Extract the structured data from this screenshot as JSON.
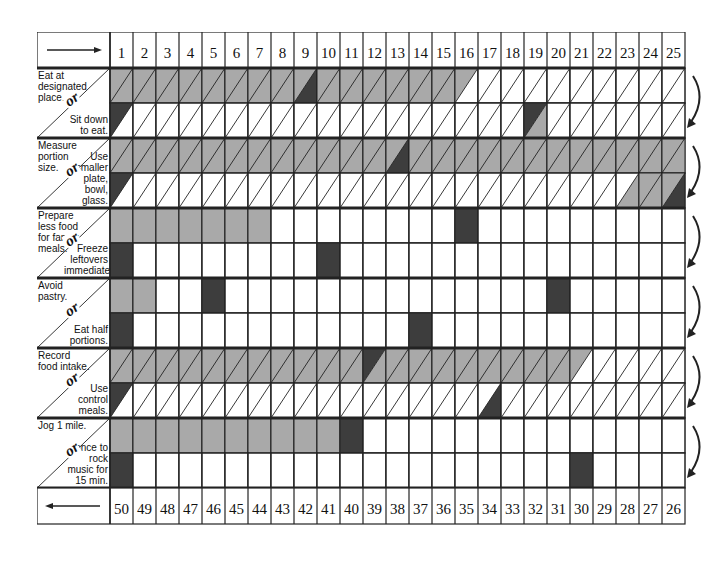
{
  "chart_data": {
    "type": "table",
    "columns_top": [
      1,
      2,
      3,
      4,
      5,
      6,
      7,
      8,
      9,
      10,
      11,
      12,
      13,
      14,
      15,
      16,
      17,
      18,
      19,
      20,
      21,
      22,
      23,
      24,
      25
    ],
    "columns_bottom": [
      50,
      49,
      48,
      47,
      46,
      45,
      44,
      43,
      42,
      41,
      40,
      39,
      38,
      37,
      36,
      35,
      34,
      33,
      32,
      31,
      30,
      29,
      28,
      27,
      26
    ],
    "header_arrow": "right",
    "footer_arrow": "left",
    "colors": {
      "gray": "#a9a9a9",
      "dark": "#3d3d3d",
      "line": "#222222"
    },
    "blocks": [
      {
        "goal": "Eat at designated place.",
        "alternative": "Sit down to eat.",
        "diagonal": true,
        "top": [
          "g",
          "g",
          "g",
          "g",
          "g",
          "g",
          "g",
          "g",
          "gD",
          "g",
          "g",
          "g",
          "g",
          "g",
          "g",
          "gul",
          "",
          "",
          "",
          "",
          "",
          "",
          "",
          "",
          ""
        ],
        "bottom": [
          "D",
          "",
          "",
          "",
          "",
          "",
          "",
          "",
          "",
          "",
          "",
          "",
          "",
          "",
          "",
          "",
          "",
          "",
          "Dul",
          "",
          "",
          "",
          "",
          "",
          ""
        ]
      },
      {
        "goal": "Measure portion size.",
        "alternative": "Use smaller plate, bowl, glass.",
        "diagonal": true,
        "top": [
          "g",
          "g",
          "g",
          "g",
          "g",
          "g",
          "g",
          "g",
          "g",
          "g",
          "g",
          "g",
          "gD",
          "g",
          "g",
          "g",
          "g",
          "g",
          "g",
          "g",
          "g",
          "g",
          "g",
          "g",
          "g"
        ],
        "bottom": [
          "D",
          "",
          "",
          "",
          "",
          "",
          "",
          "",
          "",
          "",
          "",
          "",
          "",
          "",
          "",
          "",
          "",
          "",
          "",
          "",
          "",
          "",
          "glr",
          "g",
          "gD"
        ]
      },
      {
        "goal": "Prepare less food for family meals.",
        "alternative": "Freeze leftovers immediately.",
        "diagonal": false,
        "top": [
          "g",
          "g",
          "g",
          "g",
          "g",
          "g",
          "g",
          "",
          "",
          "",
          "",
          "",
          "",
          "",
          "",
          "G",
          "",
          "",
          "",
          "",
          "",
          "",
          "",
          "",
          ""
        ],
        "bottom": [
          "G",
          "",
          "",
          "",
          "",
          "",
          "",
          "",
          "",
          "G",
          "",
          "",
          "",
          "",
          "",
          "",
          "",
          "",
          "",
          "",
          "",
          "",
          "",
          "",
          ""
        ]
      },
      {
        "goal": "Avoid pastry.",
        "alternative": "Eat half portions.",
        "diagonal": false,
        "top": [
          "g",
          "g",
          "",
          "",
          "G",
          "",
          "",
          "",
          "",
          "",
          "",
          "",
          "",
          "",
          "",
          "",
          "",
          "",
          "",
          "G",
          "",
          "",
          "",
          "",
          ""
        ],
        "bottom": [
          "G",
          "",
          "",
          "",
          "",
          "",
          "",
          "",
          "",
          "",
          "",
          "",
          "",
          "G",
          "",
          "",
          "",
          "",
          "",
          "",
          "",
          "",
          "",
          "",
          ""
        ]
      },
      {
        "goal": "Record food intake.",
        "alternative": "Use control meals.",
        "diagonal": true,
        "top": [
          "g",
          "g",
          "g",
          "g",
          "g",
          "g",
          "g",
          "g",
          "g",
          "g",
          "g",
          "Dul",
          "g",
          "g",
          "g",
          "g",
          "g",
          "g",
          "g",
          "g",
          "gul",
          "",
          "",
          "",
          ""
        ],
        "bottom": [
          "D",
          "",
          "",
          "",
          "",
          "",
          "",
          "",
          "",
          "",
          "",
          "",
          "",
          "",
          "",
          "",
          "Dlr",
          "",
          "",
          "",
          "",
          "",
          "",
          "",
          ""
        ]
      },
      {
        "goal": "Jog 1 mile.",
        "alternative": "Dance to rock music for 15 min.",
        "diagonal": false,
        "top": [
          "g",
          "g",
          "g",
          "g",
          "g",
          "g",
          "g",
          "g",
          "g",
          "g",
          "G",
          "",
          "",
          "",
          "",
          "",
          "",
          "",
          "",
          "",
          "",
          "",
          "",
          "",
          ""
        ],
        "bottom": [
          "G",
          "",
          "",
          "",
          "",
          "",
          "",
          "",
          "",
          "",
          "",
          "",
          "",
          "",
          "",
          "",
          "",
          "",
          "",
          "",
          "G",
          "",
          "",
          "",
          ""
        ]
      }
    ],
    "connector_word": "or"
  },
  "header": {
    "arrow": "→"
  },
  "footer": {
    "arrow": "←"
  }
}
